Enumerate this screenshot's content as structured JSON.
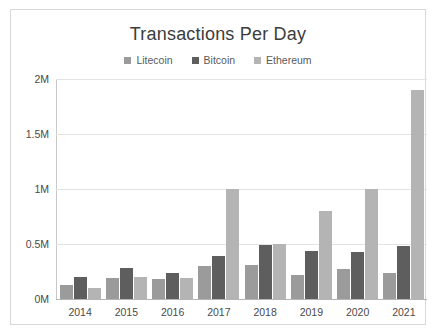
{
  "chart_data": {
    "type": "bar",
    "title": "Transactions Per Day",
    "xlabel": "",
    "ylabel": "",
    "categories": [
      "2014",
      "2015",
      "2016",
      "2017",
      "2018",
      "2019",
      "2020",
      "2021"
    ],
    "series": [
      {
        "name": "Litecoin",
        "color": "#9b9b9b",
        "values": [
          0.13,
          0.19,
          0.18,
          0.3,
          0.31,
          0.22,
          0.27,
          0.24
        ]
      },
      {
        "name": "Bitcoin",
        "color": "#5e5e5e",
        "values": [
          0.2,
          0.28,
          0.24,
          0.39,
          0.49,
          0.44,
          0.43,
          0.48
        ]
      },
      {
        "name": "Ethereum",
        "color": "#b4b4b4",
        "values": [
          0.1,
          0.2,
          0.19,
          1.0,
          0.5,
          0.8,
          1.0,
          1.9
        ]
      }
    ],
    "ylim": [
      0,
      2
    ],
    "yticks": [
      0,
      0.5,
      1,
      1.5,
      2
    ],
    "ytick_labels": [
      "0M",
      "0.5M",
      "1M",
      "1.5M",
      "2M"
    ],
    "grid": true,
    "legend_position": "top",
    "value_unit": "millions of transactions per day"
  },
  "legend": {
    "items": [
      {
        "label": "Litecoin"
      },
      {
        "label": "Bitcoin"
      },
      {
        "label": "Ethereum"
      }
    ]
  }
}
